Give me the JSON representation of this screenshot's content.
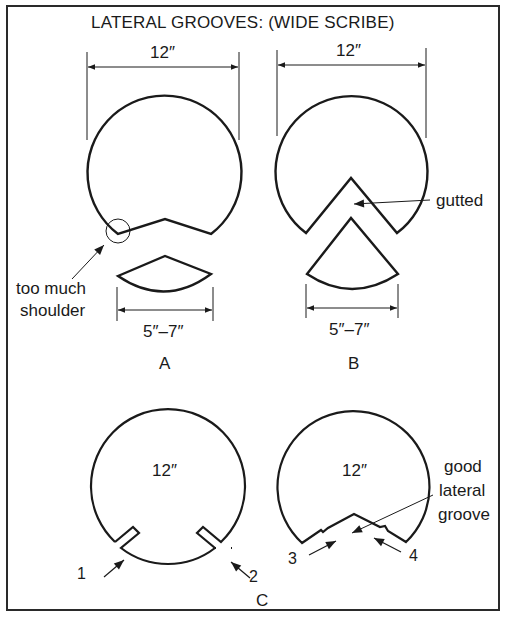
{
  "title": "LATERAL GROOVES: (WIDE SCRIBE)",
  "figure_a": {
    "diameter_label": "12″",
    "piece_width_label": "5″–7″",
    "callout_line1": "too much",
    "callout_line2": "shoulder",
    "panel_label": "A"
  },
  "figure_b": {
    "diameter_label": "12″",
    "piece_width_label": "5″–7″",
    "callout": "gutted",
    "panel_label": "B"
  },
  "figure_c": {
    "left_diameter_label": "12″",
    "right_diameter_label": "12″",
    "callout_line1": "good",
    "callout_line2": "lateral",
    "callout_line3": "groove",
    "cut_labels": [
      "1",
      "2",
      "3",
      "4"
    ],
    "panel_label": "C"
  },
  "colors": {
    "ink": "#1a1a1a",
    "background": "#ffffff"
  }
}
